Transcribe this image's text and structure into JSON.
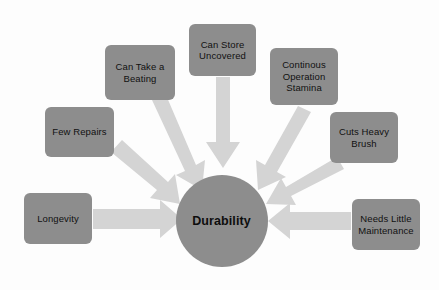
{
  "diagram": {
    "type": "hub-and-spoke",
    "title": "Durability",
    "palette": {
      "background": "#fdfdfd",
      "node_fill": "#8d8d8d",
      "hub_fill": "#8d8d8d",
      "arrow_fill": "#d4d4d4",
      "text": "#111111"
    },
    "hub": {
      "label": "Durability",
      "cx": 221.5,
      "cy": 220.5,
      "r": 46
    },
    "nodes": [
      {
        "id": "few-repairs",
        "label": "Few Repairs",
        "x": 45,
        "y": 107,
        "w": 69,
        "h": 50
      },
      {
        "id": "can-take-a-beating",
        "label": "Can Take a\nBeating",
        "x": 105,
        "y": 45,
        "w": 70,
        "h": 55
      },
      {
        "id": "can-store-uncovered",
        "label": "Can Store\nUncovered",
        "x": 189,
        "y": 24,
        "w": 67,
        "h": 52
      },
      {
        "id": "continous-operation-stamina",
        "label": "Continous\nOperation\nStamina",
        "x": 270,
        "y": 48,
        "w": 68,
        "h": 57
      },
      {
        "id": "cuts-heavy-brush",
        "label": "Cuts Heavy\nBrush",
        "x": 330,
        "y": 112,
        "w": 68,
        "h": 51
      },
      {
        "id": "longevity",
        "label": "Longevity",
        "x": 24,
        "y": 193,
        "w": 68,
        "h": 51
      },
      {
        "id": "needs-little-maintenance",
        "label": "Needs Little\nMaintenance",
        "x": 352,
        "y": 199,
        "w": 68,
        "h": 51
      }
    ],
    "arrows": [
      {
        "id": "arrow-few-repairs",
        "from": "few-repairs",
        "to": "hub"
      },
      {
        "id": "arrow-can-take-a-beating",
        "from": "can-take-a-beating",
        "to": "hub"
      },
      {
        "id": "arrow-can-store-uncovered",
        "from": "can-store-uncovered",
        "to": "hub"
      },
      {
        "id": "arrow-continous-operation-stamina",
        "from": "continous-operation-stamina",
        "to": "hub"
      },
      {
        "id": "arrow-cuts-heavy-brush",
        "from": "cuts-heavy-brush",
        "to": "hub"
      },
      {
        "id": "arrow-longevity",
        "from": "longevity",
        "to": "hub"
      },
      {
        "id": "arrow-needs-little-maintenance",
        "from": "needs-little-maintenance",
        "to": "hub"
      }
    ]
  }
}
